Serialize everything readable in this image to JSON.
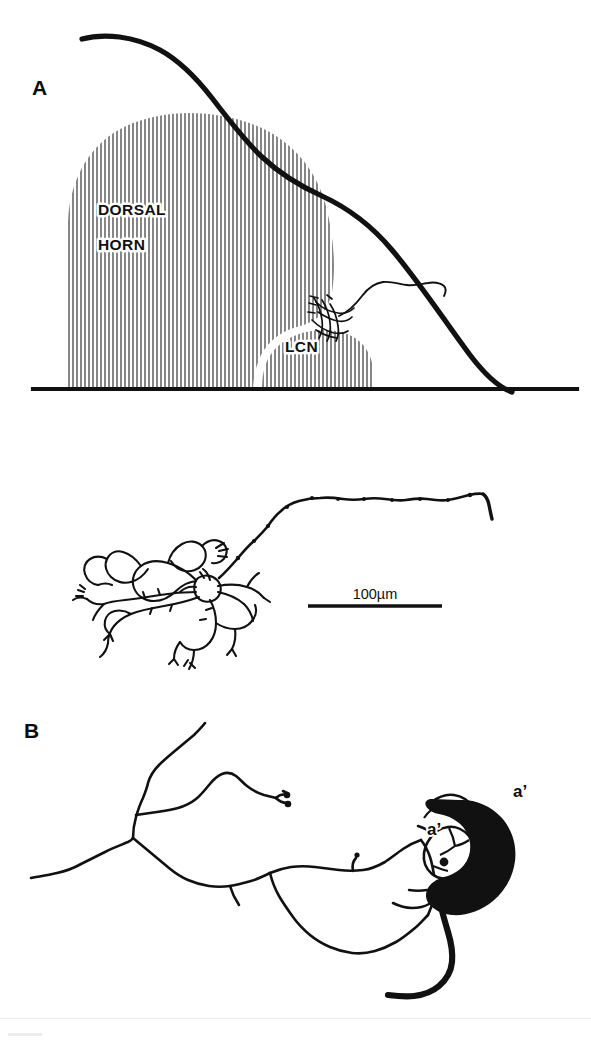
{
  "figure": {
    "kind": "neuroanatomical-line-drawing",
    "background_color": "#ffffff",
    "ink_color": "#111111",
    "width": 591,
    "height": 1042
  },
  "panel_a": {
    "letter": "A",
    "labels": {
      "dorsal": "DORSAL",
      "horn": "HORN",
      "lcn": "LCN"
    },
    "description": "Transverse outline of spinal cord grey matter with vertically hatched dorsal horn and lateral cervical nucleus, containing an injected neuron"
  },
  "panel_middle": {
    "scale_bar_label": "100µm",
    "description": "Camera lucida reconstruction of the labelled neuron: dendritic arbor at left, axon ascending and running to the right"
  },
  "panel_b": {
    "letter": "B",
    "labels": {
      "soma_left": "a’",
      "soma_right": "a’"
    },
    "description": "Higher magnification drawing of the neuron soma with darkly filled region and radiating dendrites"
  }
}
